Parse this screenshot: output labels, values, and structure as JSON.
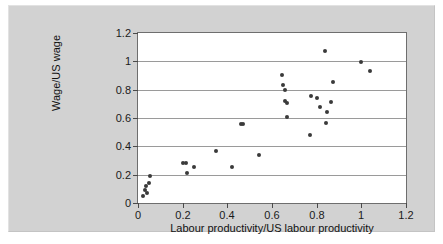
{
  "chart_data": {
    "type": "scatter",
    "title": "",
    "xlabel": "Labour productivity/US labour productivity",
    "ylabel": "Wage/US wage",
    "xlim": [
      0,
      1.2
    ],
    "ylim": [
      0,
      1.2
    ],
    "xticks": [
      "0",
      "0.2",
      "0.4",
      "0.6",
      "0.8",
      "1",
      "1.2"
    ],
    "xtick_values": [
      0,
      0.2,
      0.4,
      0.6,
      0.8,
      1.0,
      1.2
    ],
    "yticks": [
      "0",
      "0.2",
      "0.4",
      "0.6",
      "0.8",
      "1",
      "1.2"
    ],
    "ytick_values": [
      0,
      0.2,
      0.4,
      0.6,
      0.8,
      1.0,
      1.2
    ],
    "grid": "horizontal",
    "legend": "none",
    "marker_color": "#3a3a3a",
    "plot_background": "#ffffff",
    "figure_background": "#d2d2d2",
    "points": [
      {
        "x": 0.02,
        "y": 0.05
      },
      {
        "x": 0.03,
        "y": 0.09
      },
      {
        "x": 0.035,
        "y": 0.12
      },
      {
        "x": 0.04,
        "y": 0.07
      },
      {
        "x": 0.05,
        "y": 0.145
      },
      {
        "x": 0.055,
        "y": 0.19
      },
      {
        "x": 0.2,
        "y": 0.285
      },
      {
        "x": 0.215,
        "y": 0.285
      },
      {
        "x": 0.22,
        "y": 0.215
      },
      {
        "x": 0.25,
        "y": 0.255
      },
      {
        "x": 0.35,
        "y": 0.37
      },
      {
        "x": 0.42,
        "y": 0.255
      },
      {
        "x": 0.46,
        "y": 0.56
      },
      {
        "x": 0.47,
        "y": 0.56
      },
      {
        "x": 0.54,
        "y": 0.34
      },
      {
        "x": 0.645,
        "y": 0.905
      },
      {
        "x": 0.65,
        "y": 0.835
      },
      {
        "x": 0.66,
        "y": 0.795
      },
      {
        "x": 0.66,
        "y": 0.72
      },
      {
        "x": 0.665,
        "y": 0.705
      },
      {
        "x": 0.665,
        "y": 0.61
      },
      {
        "x": 0.77,
        "y": 0.48
      },
      {
        "x": 0.775,
        "y": 0.755
      },
      {
        "x": 0.8,
        "y": 0.74
      },
      {
        "x": 0.815,
        "y": 0.675
      },
      {
        "x": 0.835,
        "y": 1.07
      },
      {
        "x": 0.84,
        "y": 0.565
      },
      {
        "x": 0.845,
        "y": 0.645
      },
      {
        "x": 0.865,
        "y": 0.715
      },
      {
        "x": 0.875,
        "y": 0.855
      },
      {
        "x": 1.0,
        "y": 0.995
      },
      {
        "x": 1.04,
        "y": 0.935
      }
    ]
  }
}
